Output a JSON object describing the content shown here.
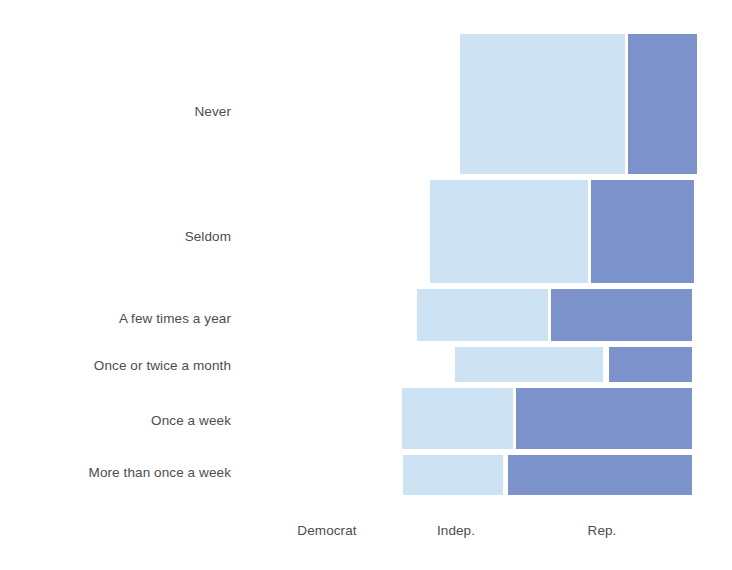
{
  "chart_data": {
    "type": "bar",
    "subtype": "mosaic-spine-plot",
    "title": "",
    "subtitle": "",
    "xlabel": "",
    "ylabel": "",
    "grid": false,
    "legend": "none",
    "orientation": "horizontal",
    "categories": [
      "Never",
      "Seldom",
      "A few times a year",
      "Once or twice a month",
      "Once a week",
      "More than once a week"
    ],
    "x_tick_labels": [
      "Democrat",
      "Indep.",
      "Rep."
    ],
    "series": [
      {
        "name": "Democrat",
        "color": "#cde2f2",
        "values": [
          0.0,
          0.0,
          0.0,
          0.0,
          0.0,
          0.0
        ]
      },
      {
        "name": "Indep.",
        "color": "#cde2f2",
        "values": [
          0.7,
          0.61,
          0.49,
          0.62,
          0.39,
          0.35
        ]
      },
      {
        "name": "Rep.",
        "color": "#7b93ca",
        "values": [
          0.3,
          0.39,
          0.51,
          0.38,
          0.61,
          0.65
        ]
      }
    ],
    "row_widths_px": [
      237,
      264,
      275,
      237,
      290,
      289
    ],
    "row_heights_px": [
      140,
      103,
      52,
      35,
      61,
      40
    ],
    "colors": {
      "light_blue": "#cde2f2",
      "dark_blue": "#7b93ca",
      "background": "#ffffff",
      "text": "#4d4d4d"
    },
    "tiles": [
      {
        "row": "Never",
        "group": "Indep.",
        "x": 460,
        "y": 34,
        "w": 165,
        "h": 140,
        "color": "#cde2f2"
      },
      {
        "row": "Never",
        "group": "Rep.",
        "x": 628,
        "y": 34,
        "w": 69,
        "h": 140,
        "color": "#7b93ca"
      },
      {
        "row": "Seldom",
        "group": "Indep.",
        "x": 430,
        "y": 180,
        "w": 158,
        "h": 103,
        "color": "#cde2f2"
      },
      {
        "row": "Seldom",
        "group": "Rep.",
        "x": 591,
        "y": 180,
        "w": 103,
        "h": 103,
        "color": "#7b93ca"
      },
      {
        "row": "A few times a year",
        "group": "Indep.",
        "x": 417,
        "y": 289,
        "w": 131,
        "h": 52,
        "color": "#cde2f2"
      },
      {
        "row": "A few times a year",
        "group": "Rep.",
        "x": 551,
        "y": 289,
        "w": 141,
        "h": 52,
        "color": "#7b93ca"
      },
      {
        "row": "Once or twice a month",
        "group": "Indep.",
        "x": 455,
        "y": 347,
        "w": 148,
        "h": 35,
        "color": "#cde2f2"
      },
      {
        "row": "Once or twice a month",
        "group": "Rep.",
        "x": 609,
        "y": 347,
        "w": 83,
        "h": 35,
        "color": "#7b93ca"
      },
      {
        "row": "Once a week",
        "group": "Indep.",
        "x": 402,
        "y": 388,
        "w": 111,
        "h": 61,
        "color": "#cde2f2"
      },
      {
        "row": "Once a week",
        "group": "Rep.",
        "x": 516,
        "y": 388,
        "w": 176,
        "h": 61,
        "color": "#7b93ca"
      },
      {
        "row": "More than once a week",
        "group": "Indep.",
        "x": 403,
        "y": 455,
        "w": 100,
        "h": 40,
        "color": "#cde2f2"
      },
      {
        "row": "More than once a week",
        "group": "Rep.",
        "x": 508,
        "y": 455,
        "w": 184,
        "h": 40,
        "color": "#7b93ca"
      }
    ],
    "row_label_positions": [
      {
        "label": "Never",
        "right": 231,
        "y": 112
      },
      {
        "label": "Seldom",
        "right": 231,
        "y": 237
      },
      {
        "label": "A few times a year",
        "right": 231,
        "y": 319
      },
      {
        "label": "Once or twice a month",
        "right": 231,
        "y": 366
      },
      {
        "label": "Once a week",
        "right": 231,
        "y": 421
      },
      {
        "label": "More than once a week",
        "right": 231,
        "y": 473
      }
    ],
    "x_tick_positions": [
      {
        "label": "Democrat",
        "center": 327,
        "y": 531
      },
      {
        "label": "Indep.",
        "center": 456,
        "y": 531
      },
      {
        "label": "Rep.",
        "center": 602,
        "y": 531
      }
    ]
  }
}
